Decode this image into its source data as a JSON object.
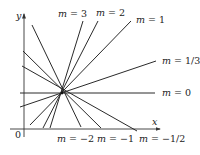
{
  "diagram": {
    "center": {
      "x": 62,
      "y": 93
    },
    "axes": {
      "x_label": "x",
      "y_label": "y",
      "origin_label": "0",
      "x_axis": {
        "x1": 10,
        "y1": 129,
        "x2": 160,
        "y2": 129
      },
      "y_axis": {
        "x1": 24,
        "y1": 137,
        "x2": 24,
        "y2": 14
      }
    },
    "lines": [
      {
        "m": "3",
        "label": "m = 3",
        "x1": 50,
        "y1": 128,
        "x2": 83,
        "y2": 21,
        "lx": 58,
        "ly": 17,
        "anchor": "start"
      },
      {
        "m": "2",
        "label": "m = 2",
        "x1": 43,
        "y1": 128,
        "x2": 98,
        "y2": 21,
        "lx": 96,
        "ly": 16,
        "anchor": "start"
      },
      {
        "m": "1",
        "label": "m = 1",
        "x1": 30,
        "y1": 125,
        "x2": 131,
        "y2": 21,
        "lx": 136,
        "ly": 23,
        "anchor": "start"
      },
      {
        "m": "1/3",
        "label": "m = 1/3",
        "x1": 20,
        "y1": 107,
        "x2": 156,
        "y2": 61,
        "lx": 162,
        "ly": 64,
        "anchor": "start"
      },
      {
        "m": "0",
        "label": "m = 0",
        "x1": 20,
        "y1": 93,
        "x2": 155,
        "y2": 93,
        "lx": 162,
        "ly": 96,
        "anchor": "start"
      },
      {
        "m": "-2",
        "label": "m = −2",
        "x1": 32,
        "y1": 25,
        "x2": 81,
        "y2": 127,
        "lx": 57,
        "ly": 142,
        "anchor": "start"
      },
      {
        "m": "-1",
        "label": "m = −1",
        "x1": 23,
        "y1": 51,
        "x2": 101,
        "y2": 128,
        "lx": 97,
        "ly": 142,
        "anchor": "start"
      },
      {
        "m": "-1/2",
        "label": "m = −1/2",
        "x1": 22,
        "y1": 66,
        "x2": 137,
        "y2": 131,
        "lx": 139,
        "ly": 142,
        "anchor": "start"
      }
    ],
    "colors": {
      "line": "#2a2a2a",
      "text": "#222222",
      "background": "#ffffff"
    }
  }
}
